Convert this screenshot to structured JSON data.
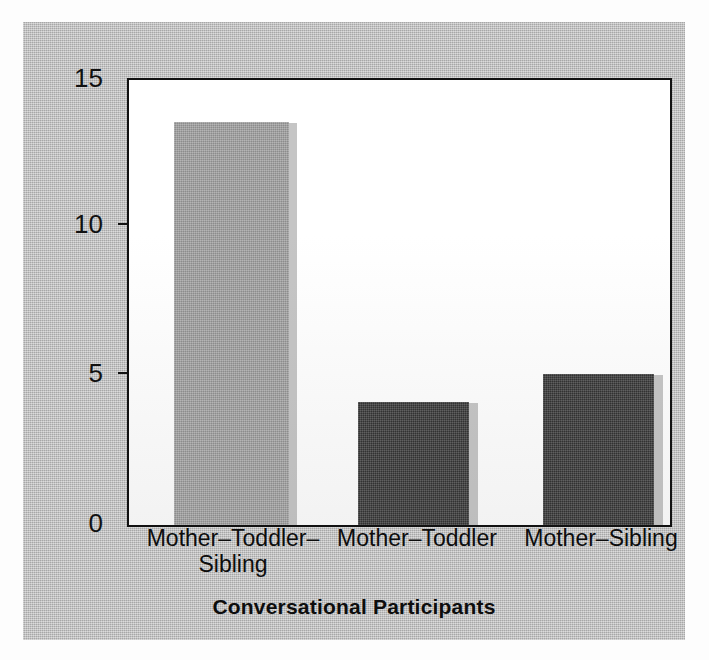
{
  "chart_data": {
    "type": "bar",
    "title": "",
    "xlabel": "Conversational Participants",
    "ylabel": "Mean Length of Conversation in Turns",
    "categories": [
      "Mother–Toddler–\nSibling",
      "Mother–Toddler",
      "Mother–Sibling"
    ],
    "values": [
      13.6,
      4.15,
      5.1
    ],
    "bar_colors": [
      "#a3a3a3",
      "#3a3a3a",
      "#3a3a3a"
    ],
    "ylim": [
      0,
      15
    ],
    "yticks": [
      0,
      5,
      10,
      15
    ],
    "ytick_labels": [
      "0",
      "5",
      "10",
      "15"
    ],
    "grid": false,
    "legend": null,
    "series": [
      {
        "name": "Mean Length of Conversation in Turns",
        "values": [
          13.6,
          4.15,
          5.1
        ]
      }
    ]
  },
  "axis": {
    "y_title": "Mean Length of Conversation in Turns",
    "x_title": "Conversational Participants",
    "y_labels": [
      "15",
      "10",
      "5",
      "0"
    ]
  },
  "categories": [
    {
      "label": "Mother–Toddler–\nSibling",
      "value": "13.6"
    },
    {
      "label": "Mother–Toddler",
      "value": "4.15"
    },
    {
      "label": "Mother–Sibling",
      "value": "5.1"
    }
  ],
  "colors": {
    "panel_background": "#b9b9b9",
    "plot_background": "#ffffff",
    "axis": "#111111",
    "bar_light": "#a3a3a3",
    "bar_dark": "#3a3a3a",
    "shadow": "#6e6e6e"
  }
}
